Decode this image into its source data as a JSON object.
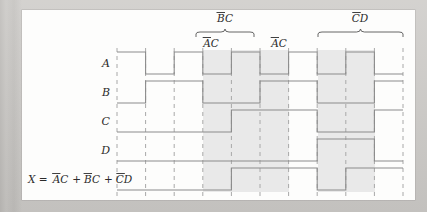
{
  "figure": {
    "kind": "digital-timing-diagram",
    "background_color": "#c8c6c3",
    "panel_color": "#fdfdfc",
    "waveform_color": "#8b8b8b",
    "gridline_color": "#a8a8a8",
    "highlight_color": "#e9e9e9",
    "time_slots": 10,
    "x_start": 117,
    "x_end": 403,
    "slot_width": 28.6
  },
  "signals": [
    {
      "name": "A",
      "label": "A",
      "row_index": 0,
      "description": "period 2 slots, high during first half of each pair",
      "values": [
        1,
        0,
        1,
        0,
        1,
        0,
        1,
        0,
        1,
        0
      ]
    },
    {
      "name": "B",
      "label": "B",
      "row_index": 1,
      "description": "period 4 slots",
      "values": [
        0,
        1,
        1,
        0,
        0,
        1,
        1,
        0,
        0,
        1
      ]
    },
    {
      "name": "C",
      "label": "C",
      "row_index": 2,
      "description": "period 8 slots",
      "values": [
        0,
        0,
        0,
        0,
        1,
        1,
        1,
        0,
        0,
        1
      ]
    },
    {
      "name": "D",
      "label": "D",
      "row_index": 3,
      "description": "high during slots 8 and 9",
      "values": [
        0,
        0,
        0,
        0,
        0,
        0,
        0,
        1,
        1,
        0
      ]
    },
    {
      "name": "X",
      "label": "X = ĀC + ĀC + ĀD",
      "row_index": 4,
      "description": "output waveform",
      "values": [
        0,
        0,
        0,
        0,
        1,
        1,
        1,
        0,
        1,
        1
      ]
    }
  ],
  "output": {
    "equation_parts": {
      "lhs": "X",
      "equals": "=",
      "term1_var1": "A",
      "term1_bar": true,
      "term1_var2": "C",
      "plus1": "+",
      "term2_var1": "B",
      "term2_bar": true,
      "term2_var2": "C",
      "plus2": "+",
      "term3_var1": "C",
      "term3_bar": true,
      "term3_var2": "D"
    },
    "equation_text": "X = ĀC + B̄C + C̄D"
  },
  "annotations": [
    {
      "id": "bc-brace",
      "label_var1": "B",
      "label_bar": true,
      "label_var2": "C",
      "label_text": "B̄C",
      "span_slots": [
        5,
        7
      ],
      "level": "top",
      "brace_x1": 196,
      "brace_x2": 254,
      "brace_y": 37,
      "label_x": 225,
      "label_y": 22
    },
    {
      "id": "ac-brace-left",
      "label_var1": "A",
      "label_bar": true,
      "label_var2": "C",
      "label_text": "ĀC",
      "span_slots": [
        5,
        5
      ],
      "level": "second",
      "label_x": 211,
      "label_y": 47
    },
    {
      "id": "ac-brace-right",
      "label_var1": "A",
      "label_bar": true,
      "label_var2": "C",
      "label_text": "ĀC",
      "span_slots": [
        7,
        7
      ],
      "level": "second",
      "label_x": 279,
      "label_y": 47
    },
    {
      "id": "cd-brace",
      "label_var1": "C",
      "label_bar": true,
      "label_var2": "D",
      "label_text": "C̄D",
      "span_slots": [
        8,
        10
      ],
      "level": "top",
      "brace_x1": 318,
      "brace_x2": 403,
      "brace_y": 37,
      "label_x": 360,
      "label_y": 22
    }
  ],
  "highlight_bands": [
    {
      "id": "band-bc",
      "x": 203,
      "width": 86,
      "from_slot": 4,
      "to_slot": 7
    },
    {
      "id": "band-cd",
      "x": 318,
      "width": 57,
      "from_slot": 8,
      "to_slot": 9
    }
  ]
}
